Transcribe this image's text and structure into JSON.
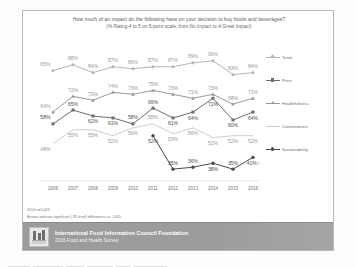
{
  "slide": {
    "title_line1": "How much of an impact do the following have on your decision to buy foods and beverages?",
    "title_line2_a": "(% Rating 4 to 5 on 5-point scale, from ",
    "title_line2_b": "No Impact",
    "title_line2_c": " to ",
    "title_line2_d": "A Great Impact",
    "title_line2_e": ")"
  },
  "footnotes": {
    "line1": "2016 n=1,003",
    "line2": "Arrows indicate significant (.95 level) differences vs. 2015."
  },
  "banner": {
    "org": "International Food Information Council Foundation",
    "survey": "2016 Food and Health Survey",
    "logo_icon": "ific-logo-icon",
    "bg_color": "#9c9c9c"
  },
  "legend": {
    "position": "right",
    "items": [
      {
        "label": "Taste",
        "color": "#b7b7b7",
        "marker": "diamond"
      },
      {
        "label": "Price",
        "color": "#6e6e6e",
        "marker": "square"
      },
      {
        "label": "Healthfulness",
        "color": "#9a9a9a",
        "marker": "triangle"
      },
      {
        "label": "Convenience",
        "color": "#cfcfcf",
        "marker": "none"
      },
      {
        "label": "Sustainability",
        "color": "#4a4a4a",
        "marker": "circle"
      }
    ]
  },
  "chart_data": {
    "type": "line",
    "title": "How much of an impact do the following have on your decision to buy foods and beverages?",
    "subtitle": "(% Rating 4 to 5 on 5-point scale, from No Impact to A Great Impact)",
    "xlabel": "",
    "ylabel": "",
    "ylim": [
      30,
      95
    ],
    "grid": false,
    "legend_position": "right",
    "categories": [
      "2006",
      "2007",
      "2008",
      "2009",
      "2010",
      "2011",
      "2012",
      "2013",
      "2014",
      "2015",
      "2016"
    ],
    "series": [
      {
        "name": "Taste",
        "color": "#b7b7b7",
        "values": [
          85,
          88,
          84,
          87,
          86,
          87,
          87,
          89,
          90,
          83,
          84
        ],
        "labels": [
          "85%",
          "88%",
          "84%",
          "87%",
          "86%",
          "87%",
          "87%",
          "89%",
          "90%",
          "83%",
          "84%"
        ]
      },
      {
        "name": "Price",
        "color": "#6e6e6e",
        "values": [
          58,
          65,
          62,
          61,
          58,
          66,
          61,
          64,
          71,
          60,
          64
        ],
        "labels": [
          "58%",
          "65%",
          "62%",
          "61%",
          "58%",
          "66%",
          "61%",
          "64%",
          "71%",
          "60%",
          "64%"
        ]
      },
      {
        "name": "Healthfulness",
        "color": "#9a9a9a",
        "values": [
          64,
          72,
          70,
          74,
          73,
          75,
          73,
          71,
          73,
          68,
          71
        ],
        "labels": [
          "64%",
          "72%",
          "70%",
          "74%",
          "73%",
          "75%",
          "73%",
          "71%",
          "73%",
          "68%",
          "71%"
        ]
      },
      {
        "name": "Convenience",
        "color": "#cfcfcf",
        "values": [
          48,
          55,
          55,
          52,
          56,
          58,
          53,
          56,
          51,
          52,
          52
        ],
        "labels": [
          "48%",
          "55%",
          "55%",
          "52%",
          "56%",
          "58%",
          "53%",
          "56%",
          "51%",
          "52%",
          "52%"
        ]
      },
      {
        "name": "Sustainability",
        "color": "#4a4a4a",
        "values": [
          null,
          null,
          null,
          null,
          null,
          52,
          35,
          36,
          38,
          35,
          41
        ],
        "labels": [
          "",
          "",
          "",
          "",
          "",
          "52%",
          "35%",
          "36%",
          "38%",
          "35%",
          "41%"
        ],
        "last_label_suffix": "↑"
      }
    ]
  }
}
